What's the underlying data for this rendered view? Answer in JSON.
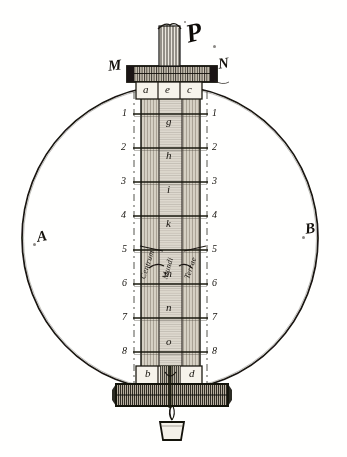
{
  "figure": {
    "kind": "engraving",
    "caption_letter": "P",
    "sphere": {
      "left_label": "A",
      "right_label": "B"
    },
    "top_bar": {
      "left_end_label": "M",
      "right_end_label": "N",
      "cells": [
        "a",
        "e",
        "c"
      ]
    },
    "bottom_bar": {
      "left_label": "b",
      "right_label": "d"
    },
    "scale": {
      "left_numbers": [
        "1",
        "2",
        "3",
        "4",
        "5",
        "6",
        "7",
        "8"
      ],
      "right_numbers": [
        "1",
        "2",
        "3",
        "4",
        "5",
        "6",
        "7",
        "8"
      ]
    },
    "shaft_letters": [
      "g",
      "h",
      "i",
      "k",
      "m",
      "n",
      "o"
    ],
    "annotations": [
      {
        "text": "Centrum",
        "rotation": -72
      },
      {
        "text": "Mundi",
        "rotation": -74
      },
      {
        "text": "Terrae",
        "rotation": -71
      }
    ],
    "colors": {
      "ink": "#1a1712",
      "paper": "#fdfdfc",
      "wash": "#b9b2a5",
      "hatch": "#6f675b"
    }
  }
}
